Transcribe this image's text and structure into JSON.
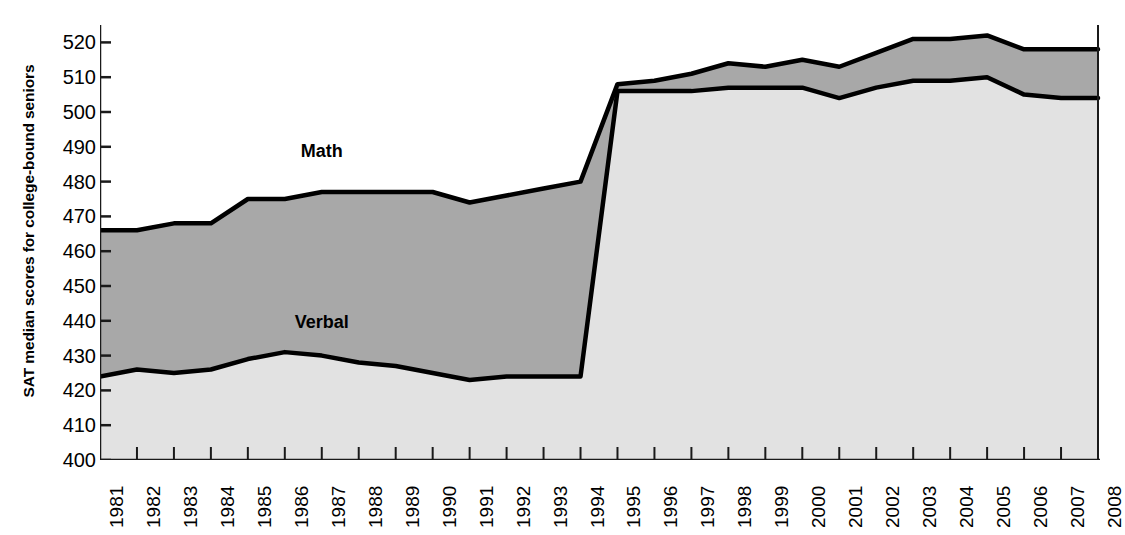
{
  "chart_data": {
    "type": "area",
    "title": "",
    "xlabel": "",
    "ylabel": "SAT median scores for college-bound seniors",
    "ylim": [
      400,
      525
    ],
    "yticks": [
      400,
      410,
      420,
      430,
      440,
      450,
      460,
      470,
      480,
      490,
      500,
      510,
      520
    ],
    "grid": false,
    "legend_position": "inline-annotation",
    "categories": [
      "1981",
      "1982",
      "1983",
      "1984",
      "1985",
      "1986",
      "1987",
      "1988",
      "1989",
      "1990",
      "1991",
      "1992",
      "1993",
      "1994",
      "1995",
      "1996",
      "1997",
      "1998",
      "1999",
      "2000",
      "2001",
      "2002",
      "2003",
      "2004",
      "2005",
      "2006",
      "2007",
      "2008"
    ],
    "series": [
      {
        "name": "Math",
        "values": [
          466,
          466,
          468,
          468,
          475,
          475,
          477,
          477,
          477,
          477,
          474,
          476,
          478,
          480,
          508,
          509,
          511,
          514,
          513,
          515,
          513,
          517,
          521,
          521,
          522,
          518,
          518,
          518
        ]
      },
      {
        "name": "Verbal",
        "values": [
          424,
          426,
          425,
          426,
          429,
          431,
          430,
          428,
          427,
          425,
          423,
          424,
          424,
          424,
          506,
          506,
          506,
          507,
          507,
          507,
          504,
          507,
          509,
          509,
          510,
          505,
          504,
          504
        ]
      }
    ],
    "annotations": [
      {
        "text": "Math",
        "year": "1987",
        "value": 487
      },
      {
        "text": "Verbal",
        "year": "1987",
        "value": 438
      }
    ],
    "colors": {
      "math_band": "#a8a8a8",
      "verbal_band": "#e2e2e2",
      "line": "#000000",
      "axis": "#1a1a1a",
      "background": "#ffffff"
    }
  }
}
